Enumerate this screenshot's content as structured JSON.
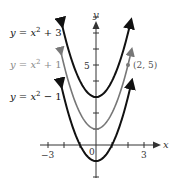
{
  "chart_data": {
    "type": "line",
    "title": "",
    "xlabel": "x",
    "ylabel": "y",
    "xlim": [
      -3.5,
      4
    ],
    "ylim": [
      -2,
      8.5
    ],
    "x_ticks": [
      -3,
      -2,
      -1,
      0,
      1,
      2,
      3
    ],
    "x_tick_labels": {
      "-3": "−3",
      "0": "0",
      "3": "3"
    },
    "y_ticks": [
      -2,
      -1,
      1,
      2,
      3,
      4,
      5,
      6,
      7,
      8
    ],
    "y_tick_labels": {
      "5": "5"
    },
    "grid": false,
    "series": [
      {
        "name": "y = x² + 3",
        "equation": "x^2 + 3",
        "shift": 3,
        "color": "#111111",
        "x": [
          -2.15,
          -2,
          -1.5,
          -1,
          -0.5,
          0,
          0.5,
          1,
          1.5,
          2,
          2.15
        ],
        "values": [
          7.62,
          7,
          5.25,
          4,
          3.25,
          3,
          3.25,
          4,
          5.25,
          7,
          7.62
        ]
      },
      {
        "name": "y = x² + 1",
        "equation": "x^2 + 1",
        "shift": 1,
        "color": "#777777",
        "x": [
          -2.2,
          -2,
          -1.5,
          -1,
          -0.5,
          0,
          0.5,
          1,
          1.5,
          2,
          2.2
        ],
        "values": [
          5.84,
          5,
          3.25,
          2,
          1.25,
          1,
          1.25,
          2,
          3.25,
          5,
          5.84
        ]
      },
      {
        "name": "y = x² − 1",
        "equation": "x^2 - 1",
        "shift": -1,
        "color": "#111111",
        "x": [
          -2.2,
          -2,
          -1.5,
          -1,
          -0.5,
          0,
          0.5,
          1,
          1.5,
          2,
          2.2
        ],
        "values": [
          3.84,
          3,
          1.25,
          0,
          -0.75,
          -1,
          -0.75,
          0,
          1.25,
          3,
          3.84
        ]
      }
    ],
    "annotations": [
      {
        "text": "(2, 5)",
        "x": 2,
        "y": 5,
        "series": "y = x² + 1"
      }
    ]
  },
  "labels": {
    "curve1": {
      "prefix": "y = x",
      "sup": "2",
      "suffix": " + 3"
    },
    "curve2": {
      "prefix": "y = x",
      "sup": "2",
      "suffix": " + 1"
    },
    "curve3": {
      "prefix": "y = x",
      "sup": "2",
      "suffix": " − 1"
    },
    "point": "(2, 5)",
    "x_axis": "x",
    "y_axis": "y",
    "tick_neg3": "−3",
    "tick_0": "0",
    "tick_3": "3",
    "tick_5": "5"
  }
}
